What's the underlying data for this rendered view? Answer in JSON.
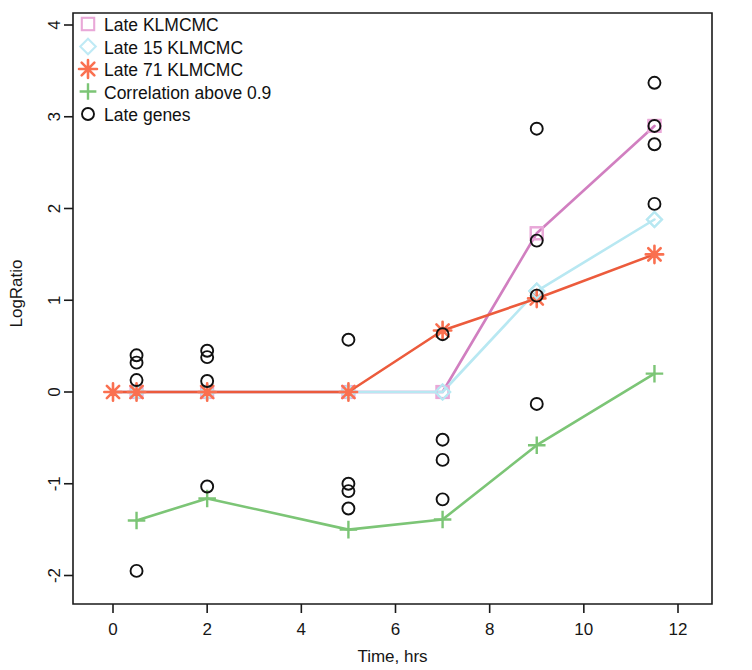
{
  "chart_data": {
    "type": "line",
    "title": "",
    "xlabel": "Time, hrs",
    "ylabel": "LogRatio",
    "xlim": [
      -0.45,
      12.35
    ],
    "ylim": [
      -2.35,
      4.25
    ],
    "xticks": [
      0,
      2,
      4,
      6,
      8,
      10,
      12
    ],
    "xticklabels": [
      "0",
      "2",
      "4",
      "6",
      "8",
      "10",
      "12"
    ],
    "yticks": [
      -2,
      -1,
      0,
      1,
      2,
      3,
      4
    ],
    "yticklabels": [
      "-2",
      "-1",
      "0",
      "1",
      "2",
      "3",
      "4"
    ],
    "grid": false,
    "legend_position": "top-left",
    "series": [
      {
        "name": "Late KLMCMC",
        "marker": "open-square",
        "color": "#d17fc0",
        "marker_color": "#e9a8d8",
        "x": [
          0,
          0.5,
          2,
          5,
          7,
          9,
          11.5
        ],
        "values": [
          0.0,
          0.0,
          0.0,
          0.0,
          0.0,
          1.73,
          2.9
        ]
      },
      {
        "name": "Late 15 KLMCMC",
        "marker": "open-diamond",
        "color": "#b8e8f2",
        "marker_color": "#b8e8f2",
        "x": [
          0,
          0.5,
          2,
          5,
          7,
          9,
          11.5
        ],
        "values": [
          0.0,
          0.0,
          0.0,
          0.0,
          0.0,
          1.1,
          1.88
        ]
      },
      {
        "name": "Late 71 KLMCMC",
        "marker": "asterisk",
        "color": "#ec5b3c",
        "marker_color": "#fa7050",
        "x": [
          0,
          0.5,
          2,
          5,
          7,
          9,
          11.5
        ],
        "values": [
          0.0,
          0.0,
          0.0,
          0.0,
          0.67,
          1.02,
          1.5
        ]
      },
      {
        "name": "Correlation above 0.9",
        "marker": "plus",
        "color": "#7cc576",
        "marker_color": "#7cc576",
        "x": [
          0.5,
          2,
          5,
          7,
          9,
          11.5
        ],
        "values": [
          -1.4,
          -1.16,
          -1.5,
          -1.39,
          -0.58,
          0.2
        ]
      }
    ],
    "scatter": {
      "name": "Late genes",
      "marker": "open-circle",
      "color": "#111111",
      "points": [
        {
          "x": 0.5,
          "y": 0.4
        },
        {
          "x": 0.5,
          "y": 0.32
        },
        {
          "x": 0.5,
          "y": 0.13
        },
        {
          "x": 0.5,
          "y": -1.95
        },
        {
          "x": 2.0,
          "y": 0.45
        },
        {
          "x": 2.0,
          "y": 0.38
        },
        {
          "x": 2.0,
          "y": 0.12
        },
        {
          "x": 2.0,
          "y": -1.03
        },
        {
          "x": 5.0,
          "y": 0.57
        },
        {
          "x": 5.0,
          "y": -1.0
        },
        {
          "x": 5.0,
          "y": -1.08
        },
        {
          "x": 5.0,
          "y": -1.27
        },
        {
          "x": 7.0,
          "y": 0.63
        },
        {
          "x": 7.0,
          "y": -0.52
        },
        {
          "x": 7.0,
          "y": -0.74
        },
        {
          "x": 7.0,
          "y": -1.17
        },
        {
          "x": 9.0,
          "y": 2.87
        },
        {
          "x": 9.0,
          "y": 1.65
        },
        {
          "x": 9.0,
          "y": 1.05
        },
        {
          "x": 9.0,
          "y": -0.13
        },
        {
          "x": 11.5,
          "y": 3.37
        },
        {
          "x": 11.5,
          "y": 2.9
        },
        {
          "x": 11.5,
          "y": 2.7
        },
        {
          "x": 11.5,
          "y": 2.05
        }
      ]
    },
    "legend": [
      {
        "label": "Late KLMCMC",
        "marker": "open-square",
        "color": "#e9a8d8"
      },
      {
        "label": "Late 15 KLMCMC",
        "marker": "open-diamond",
        "color": "#bfeaf5"
      },
      {
        "label": "Late 71 KLMCMC",
        "marker": "asterisk",
        "color": "#fa7050"
      },
      {
        "label": "Correlation above 0.9",
        "marker": "plus",
        "color": "#7cc576"
      },
      {
        "label": "Late genes",
        "marker": "open-circle",
        "color": "#111111"
      }
    ]
  }
}
